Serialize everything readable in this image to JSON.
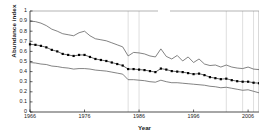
{
  "chart_data": {
    "type": "line",
    "title": "",
    "xlabel": "Year",
    "ylabel": "Abundance index",
    "xlim": [
      1966,
      2008
    ],
    "ylim": [
      0,
      1
    ],
    "xticks": [
      1966,
      1976,
      1986,
      1996,
      2006
    ],
    "yticks": [
      0,
      0.1,
      0.2,
      0.3,
      0.4,
      0.5,
      0.6,
      0.7,
      0.8,
      0.9,
      1
    ],
    "ytick_labels": [
      "0",
      "0.1",
      "0.2",
      "0.3",
      "0.4",
      "0.5",
      "0.6",
      "0.7",
      "0.8",
      "0.9",
      "1"
    ],
    "xtick_labels": [
      "1966",
      "1976",
      "1986",
      "1996",
      "2006"
    ],
    "grid": "vertical",
    "gridline_years": [
      1984,
      1986,
      2002,
      2005,
      2007
    ],
    "legend": "none",
    "marker": "square",
    "line_color": "#000000",
    "band_color": "#555555",
    "x": [
      1966,
      1967,
      1968,
      1969,
      1970,
      1971,
      1972,
      1973,
      1974,
      1975,
      1976,
      1977,
      1978,
      1979,
      1980,
      1981,
      1982,
      1983,
      1984,
      1985,
      1986,
      1987,
      1988,
      1989,
      1990,
      1991,
      1992,
      1993,
      1994,
      1995,
      1996,
      1997,
      1998,
      1999,
      2000,
      2001,
      2002,
      2003,
      2004,
      2005,
      2006,
      2007,
      2008
    ],
    "series": [
      {
        "name": "Abundance index",
        "role": "mean",
        "values": [
          0.67,
          0.665,
          0.655,
          0.64,
          0.615,
          0.6,
          0.575,
          0.565,
          0.555,
          0.565,
          0.565,
          0.545,
          0.525,
          0.515,
          0.505,
          0.49,
          0.475,
          0.46,
          0.425,
          0.425,
          0.42,
          0.415,
          0.405,
          0.395,
          0.43,
          0.42,
          0.405,
          0.4,
          0.395,
          0.385,
          0.375,
          0.38,
          0.365,
          0.345,
          0.335,
          0.325,
          0.33,
          0.315,
          0.305,
          0.3,
          0.3,
          0.29,
          0.285
        ]
      },
      {
        "name": "Upper confidence limit",
        "role": "upper",
        "values": [
          0.9,
          0.895,
          0.88,
          0.855,
          0.82,
          0.8,
          0.775,
          0.765,
          0.755,
          0.785,
          0.8,
          0.755,
          0.725,
          0.715,
          0.705,
          0.685,
          0.665,
          0.645,
          0.555,
          0.59,
          0.585,
          0.575,
          0.555,
          0.545,
          0.625,
          0.55,
          0.525,
          0.56,
          0.505,
          0.545,
          0.49,
          0.525,
          0.475,
          0.46,
          0.465,
          0.445,
          0.465,
          0.445,
          0.435,
          0.43,
          0.445,
          0.425,
          0.42
        ]
      },
      {
        "name": "Lower confidence limit",
        "role": "lower",
        "values": [
          0.49,
          0.485,
          0.475,
          0.47,
          0.455,
          0.45,
          0.44,
          0.435,
          0.425,
          0.43,
          0.43,
          0.425,
          0.415,
          0.41,
          0.405,
          0.395,
          0.385,
          0.375,
          0.32,
          0.32,
          0.315,
          0.31,
          0.3,
          0.295,
          0.315,
          0.3,
          0.29,
          0.29,
          0.285,
          0.28,
          0.275,
          0.27,
          0.265,
          0.255,
          0.25,
          0.24,
          0.245,
          0.235,
          0.225,
          0.215,
          0.22,
          0.205,
          0.19
        ]
      }
    ]
  }
}
